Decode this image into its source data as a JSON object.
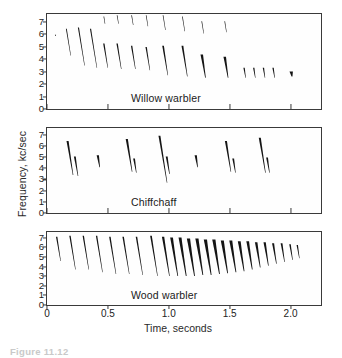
{
  "figure": {
    "caption_number": "Figure 11.12",
    "axis": {
      "y_label": "Frequency, kc/sec",
      "x_label": "Time, seconds",
      "y_ticks": [
        "0",
        "1",
        "2",
        "3",
        "4",
        "5",
        "6",
        "7"
      ],
      "x_ticks": [
        "0",
        "0.5",
        "1.0",
        "1.5",
        "2.0"
      ],
      "y_min": 0,
      "y_max": 7.6,
      "x_min": 0,
      "x_max": 2.25
    },
    "ink_color": "#141414",
    "frame_color": "#3a3a3a"
  },
  "panels": [
    {
      "id": "willow-warbler",
      "species_label": "Willow warbler"
    },
    {
      "id": "chiffchaff",
      "species_label": "Chiffchaff"
    },
    {
      "id": "wood-warbler",
      "species_label": "Wood warbler"
    }
  ],
  "chart_data": {
    "type": "line",
    "xlabel": "Time, seconds",
    "ylabel": "Frequency, kc/sec",
    "xlim": [
      0,
      2.25
    ],
    "ylim": [
      0,
      7.6
    ],
    "xticks": [
      0,
      0.5,
      1.0,
      1.5,
      2.0
    ],
    "yticks": [
      0,
      1,
      2,
      3,
      4,
      5,
      6,
      7
    ],
    "grid": false,
    "legend": "none",
    "annotations": [
      "Willow warbler",
      "Chiffchaff",
      "Wood warbler"
    ],
    "series": [
      {
        "name": "Willow warbler",
        "panel": 0,
        "description": "Song begins with a few short high notes near 6 kc/sec, then a descending series of down-slurred notes that gradually fall in pitch from about 5.5 to 2.5 kc/sec, ending in a short flourish of small notes and a terminal smear near 2.5 kc/sec.",
        "notes": [
          {
            "t": 0.07,
            "f_start": 5.9,
            "f_end": 5.8,
            "thick": 1.0
          },
          {
            "t": 0.16,
            "f_start": 6.4,
            "f_end": 4.2,
            "thick": 0.8
          },
          {
            "t": 0.26,
            "f_start": 6.5,
            "f_end": 3.4,
            "thick": 1.0
          },
          {
            "t": 0.36,
            "f_start": 6.4,
            "f_end": 3.2,
            "thick": 1.0
          },
          {
            "t": 0.47,
            "f_start": 7.4,
            "f_end": 6.8,
            "thick": 0.5
          },
          {
            "t": 0.47,
            "f_start": 5.2,
            "f_end": 3.2,
            "thick": 1.2
          },
          {
            "t": 0.58,
            "f_start": 7.5,
            "f_end": 6.8,
            "thick": 0.5
          },
          {
            "t": 0.58,
            "f_start": 5.2,
            "f_end": 3.1,
            "thick": 1.2
          },
          {
            "t": 0.7,
            "f_start": 7.5,
            "f_end": 6.7,
            "thick": 0.5
          },
          {
            "t": 0.7,
            "f_start": 5.0,
            "f_end": 3.1,
            "thick": 1.2
          },
          {
            "t": 0.82,
            "f_start": 7.5,
            "f_end": 6.6,
            "thick": 0.5
          },
          {
            "t": 0.82,
            "f_start": 4.9,
            "f_end": 3.0,
            "thick": 1.2
          },
          {
            "t": 0.96,
            "f_start": 7.5,
            "f_end": 6.3,
            "thick": 0.5
          },
          {
            "t": 0.96,
            "f_start": 5.0,
            "f_end": 2.6,
            "thick": 1.5
          },
          {
            "t": 1.12,
            "f_start": 7.4,
            "f_end": 6.2,
            "thick": 0.5
          },
          {
            "t": 1.12,
            "f_start": 5.0,
            "f_end": 2.5,
            "thick": 1.6
          },
          {
            "t": 1.28,
            "f_start": 7.0,
            "f_end": 6.0,
            "thick": 0.5
          },
          {
            "t": 1.28,
            "f_start": 4.3,
            "f_end": 2.4,
            "thick": 2.2
          },
          {
            "t": 1.47,
            "f_start": 7.0,
            "f_end": 6.1,
            "thick": 0.5
          },
          {
            "t": 1.47,
            "f_start": 4.1,
            "f_end": 2.4,
            "thick": 2.2
          },
          {
            "t": 1.63,
            "f_start": 3.2,
            "f_end": 2.4,
            "thick": 1.2
          },
          {
            "t": 1.71,
            "f_start": 3.2,
            "f_end": 2.4,
            "thick": 1.2
          },
          {
            "t": 1.79,
            "f_start": 3.2,
            "f_end": 2.4,
            "thick": 1.2
          },
          {
            "t": 1.87,
            "f_start": 3.2,
            "f_end": 2.4,
            "thick": 1.2
          },
          {
            "t": 2.02,
            "f_start": 2.9,
            "f_end": 2.5,
            "thick": 3.0
          }
        ]
      },
      {
        "name": "Chiffchaff",
        "panel": 1,
        "description": "A simple alternating series of about seven well-separated notes, each starting near 6.5 kc/sec and dropping to about 3.5 kc/sec, some with a small second down-slur; a few faint high marks near 7 kc/sec appear above.",
        "notes": [
          {
            "t": 0.17,
            "f_start": 6.4,
            "f_end": 3.3,
            "thick": 1.8
          },
          {
            "t": 0.23,
            "f_start": 5.0,
            "f_end": 3.2,
            "thick": 1.6
          },
          {
            "t": 0.42,
            "f_start": 5.1,
            "f_end": 4.0,
            "thick": 2.0
          },
          {
            "t": 0.66,
            "f_start": 6.6,
            "f_end": 3.6,
            "thick": 1.9
          },
          {
            "t": 0.72,
            "f_start": 4.8,
            "f_end": 3.5,
            "thick": 1.6
          },
          {
            "t": 0.93,
            "f_start": 6.9,
            "f_end": 2.6,
            "thick": 1.7
          },
          {
            "t": 0.99,
            "f_start": 5.0,
            "f_end": 3.4,
            "thick": 1.7
          },
          {
            "t": 1.23,
            "f_start": 5.1,
            "f_end": 4.0,
            "thick": 2.0
          },
          {
            "t": 1.48,
            "f_start": 6.4,
            "f_end": 3.6,
            "thick": 1.8
          },
          {
            "t": 1.54,
            "f_start": 4.8,
            "f_end": 3.5,
            "thick": 1.6
          },
          {
            "t": 1.76,
            "f_start": 6.7,
            "f_end": 3.5,
            "thick": 1.8
          },
          {
            "t": 1.82,
            "f_start": 4.9,
            "f_end": 3.5,
            "thick": 1.6
          }
        ]
      },
      {
        "name": "Wood warbler",
        "panel": 2,
        "description": "Begins with about eight slow, well-spaced down-slurred notes from roughly 7 to 3 kc/sec, which then accelerate after about 0.9 s into a rapid dense trill that gradually narrows in frequency range and ends near 2.1 s.",
        "notes": [
          {
            "t": 0.08,
            "f_start": 7.1,
            "f_end": 4.5,
            "thick": 1.2
          },
          {
            "t": 0.19,
            "f_start": 7.2,
            "f_end": 3.6,
            "thick": 1.2
          },
          {
            "t": 0.3,
            "f_start": 7.2,
            "f_end": 3.6,
            "thick": 1.2
          },
          {
            "t": 0.41,
            "f_start": 7.2,
            "f_end": 3.3,
            "thick": 1.2
          },
          {
            "t": 0.52,
            "f_start": 7.1,
            "f_end": 3.1,
            "thick": 1.3
          },
          {
            "t": 0.63,
            "f_start": 7.1,
            "f_end": 3.1,
            "thick": 1.3
          },
          {
            "t": 0.74,
            "f_start": 7.1,
            "f_end": 3.0,
            "thick": 1.3
          },
          {
            "t": 0.86,
            "f_start": 7.2,
            "f_end": 2.9,
            "thick": 1.5
          },
          {
            "t": 0.96,
            "f_start": 7.1,
            "f_end": 2.9,
            "thick": 2.0
          },
          {
            "t": 1.03,
            "f_start": 7.0,
            "f_end": 2.9,
            "thick": 2.4
          },
          {
            "t": 1.1,
            "f_start": 7.0,
            "f_end": 2.9,
            "thick": 2.6
          },
          {
            "t": 1.17,
            "f_start": 6.9,
            "f_end": 2.9,
            "thick": 2.8
          },
          {
            "t": 1.24,
            "f_start": 6.9,
            "f_end": 3.0,
            "thick": 2.8
          },
          {
            "t": 1.31,
            "f_start": 6.8,
            "f_end": 3.0,
            "thick": 2.8
          },
          {
            "t": 1.38,
            "f_start": 6.8,
            "f_end": 3.1,
            "thick": 2.8
          },
          {
            "t": 1.45,
            "f_start": 6.7,
            "f_end": 3.2,
            "thick": 2.7
          },
          {
            "t": 1.52,
            "f_start": 6.7,
            "f_end": 3.3,
            "thick": 2.6
          },
          {
            "t": 1.59,
            "f_start": 6.6,
            "f_end": 3.4,
            "thick": 2.5
          },
          {
            "t": 1.66,
            "f_start": 6.6,
            "f_end": 3.6,
            "thick": 2.4
          },
          {
            "t": 1.73,
            "f_start": 6.5,
            "f_end": 3.8,
            "thick": 2.2
          },
          {
            "t": 1.8,
            "f_start": 6.5,
            "f_end": 4.0,
            "thick": 2.0
          },
          {
            "t": 1.87,
            "f_start": 6.4,
            "f_end": 4.2,
            "thick": 1.8
          },
          {
            "t": 1.94,
            "f_start": 6.4,
            "f_end": 4.4,
            "thick": 1.6
          },
          {
            "t": 2.01,
            "f_start": 6.3,
            "f_end": 4.6,
            "thick": 1.4
          },
          {
            "t": 2.07,
            "f_start": 6.2,
            "f_end": 4.8,
            "thick": 1.2
          }
        ]
      }
    ]
  }
}
